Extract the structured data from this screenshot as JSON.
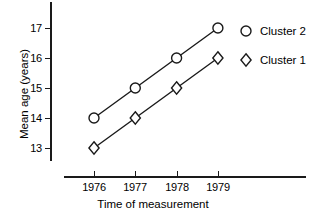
{
  "chart_data": {
    "type": "line",
    "title": "",
    "xlabel": "Time of measurement",
    "ylabel": "Mean age (years)",
    "categories": [
      "1976",
      "1977",
      "1978",
      "1979"
    ],
    "x_tick_labels": [
      "1976",
      "1977",
      "1978",
      "1979"
    ],
    "y_tick_labels": [
      "13",
      "14",
      "15",
      "16",
      "17"
    ],
    "y_ticks": [
      13,
      14,
      15,
      16,
      17
    ],
    "ylim": [
      12.6,
      17.4
    ],
    "xlim": [
      1975.5,
      1979.5
    ],
    "grid": false,
    "legend_position": "right",
    "series": [
      {
        "name": "Cluster 2",
        "marker": "circle",
        "values": [
          14,
          15,
          16,
          17
        ],
        "color": "#1a1a1a"
      },
      {
        "name": "Cluster 1",
        "marker": "diamond",
        "values": [
          13,
          14,
          15,
          16
        ],
        "color": "#1a1a1a"
      }
    ]
  },
  "axes": {
    "y_title": "Mean age (years)",
    "x_title": "Time of measurement"
  },
  "legend": {
    "entries": [
      {
        "label": "Cluster 2",
        "marker": "circle"
      },
      {
        "label": "Cluster 1",
        "marker": "diamond"
      }
    ]
  },
  "colors": {
    "ink": "#1a1a1a",
    "background": "#ffffff",
    "marker_fill": "#ffffff"
  }
}
